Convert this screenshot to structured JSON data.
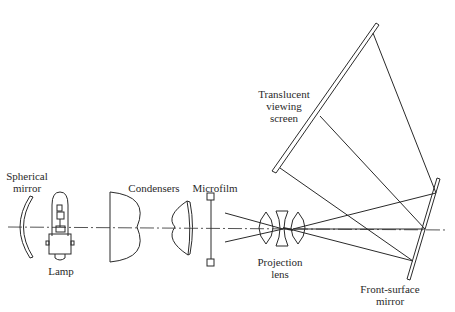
{
  "diagram": {
    "labels": {
      "spherical_mirror": [
        "Spherical",
        "mirror"
      ],
      "lamp": "Lamp",
      "condensers": "Condensers",
      "microfilm": "Microfilm",
      "projection_lens": [
        "Projection",
        "lens"
      ],
      "screen": [
        "Translucent",
        "viewing",
        "screen"
      ],
      "front_mirror": [
        "Front-surface",
        "mirror"
      ]
    },
    "colors": {
      "line": "#2a2a2a",
      "background": "#ffffff"
    }
  }
}
